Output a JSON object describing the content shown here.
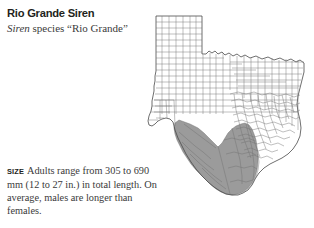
{
  "entry": {
    "common_name": "Rio Grande Siren",
    "scientific_genus": "Siren",
    "scientific_rest": " species “Rio Grande”",
    "scientific_full": "Siren species “Rio Grande”"
  },
  "size": {
    "label": "SIZE",
    "text": "Adults range from 305 to 690 mm (12 to 27 in.) in total length. On average, males are longer than females.",
    "min_mm": 305,
    "max_mm": 690,
    "min_in": 12,
    "max_in": 27
  },
  "map": {
    "name": "texas-county-range-map",
    "state": "Texas",
    "range_description": "South Texas along the Rio Grande valley and lower Gulf coast",
    "shade_color": "#9b9b9b",
    "county_line_color": "#6f6f6f",
    "state_outline_color": "#4a4a4a",
    "background_color": "#ffffff"
  }
}
